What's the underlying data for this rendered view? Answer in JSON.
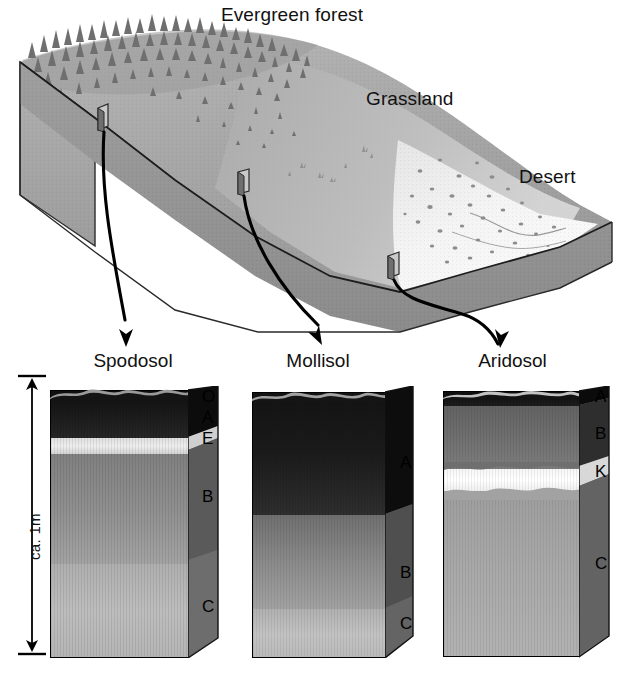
{
  "figure": {
    "type": "soil-catena-diagram"
  },
  "landscape": {
    "biomes": [
      {
        "name": "evergreen-forest",
        "label": "Evergreen forest"
      },
      {
        "name": "grassland",
        "label": "Grassland"
      },
      {
        "name": "desert",
        "label": "Desert"
      }
    ],
    "sample_sites": 3,
    "arrows": 3
  },
  "scale": {
    "label": "ca. 1m",
    "value": 1,
    "unit": "m"
  },
  "profiles": [
    {
      "name": "spodosol",
      "title": "Spodosol",
      "biome": "Evergreen forest",
      "horizons": [
        {
          "code": "O",
          "label": "O",
          "color": "#1a1a1a"
        },
        {
          "code": "A",
          "label": "A",
          "color": "#2b2b2b"
        },
        {
          "code": "E",
          "label": "E",
          "color": "#e8e8e8"
        },
        {
          "code": "B",
          "label": "B",
          "color": "#8e8e8e"
        },
        {
          "code": "C",
          "label": "C",
          "color": "#b9b9b9"
        }
      ]
    },
    {
      "name": "mollisol",
      "title": "Mollisol",
      "biome": "Grassland",
      "horizons": [
        {
          "code": "A",
          "label": "A",
          "color": "#1e1e1e"
        },
        {
          "code": "B",
          "label": "B",
          "color": "#878787"
        },
        {
          "code": "C",
          "label": "C",
          "color": "#bcbcbc"
        }
      ]
    },
    {
      "name": "aridosol",
      "title": "Aridosol",
      "biome": "Desert",
      "horizons": [
        {
          "code": "A",
          "label": "A",
          "color": "#171717"
        },
        {
          "code": "B",
          "label": "B",
          "color": "#6f6f6f"
        },
        {
          "code": "K",
          "label": "K",
          "color": "#fafafa"
        },
        {
          "code": "C",
          "label": "C",
          "color": "#a9a9a9"
        }
      ]
    }
  ],
  "colors": {
    "ink": "#000000",
    "background": "#ffffff",
    "block_face": "#a8a8a8",
    "block_side": "#8a8a8a",
    "desert_surface": "#f2f2f2"
  }
}
